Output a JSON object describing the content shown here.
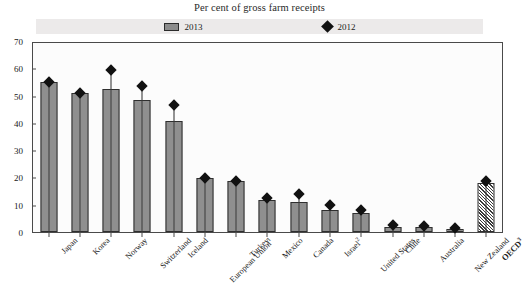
{
  "chart_data": {
    "type": "bar",
    "title": "Per cent of gross farm receipts",
    "xlabel": "",
    "ylabel": "",
    "ylim": [
      0,
      70
    ],
    "ytick_step": 10,
    "yticks": [
      0,
      10,
      20,
      30,
      40,
      50,
      60,
      70
    ],
    "grid": false,
    "legend_position": "top-center",
    "categories": [
      "Japan",
      "Korea",
      "Norway",
      "Switzerland",
      "Iceland",
      "European Union",
      "Turkey",
      "Mexico",
      "Canada",
      "Israel",
      "United States",
      "Chile",
      "Australia",
      "New Zealand",
      "OECD"
    ],
    "category_footnotes": {
      "European Union": "1",
      "Israel": "2",
      "OECD": "3"
    },
    "series": [
      {
        "name": "2013",
        "type": "bar",
        "color": "#8f8f8f",
        "values": [
          55.5,
          51.5,
          53.0,
          49.0,
          41.0,
          20.0,
          19.0,
          12.0,
          11.0,
          8.0,
          7.0,
          2.0,
          1.8,
          1.0,
          18.0
        ]
      },
      {
        "name": "2012",
        "type": "marker",
        "marker": "diamond",
        "color": "#111111",
        "values": [
          55.5,
          51.5,
          60.0,
          54.0,
          47.0,
          20.0,
          19.0,
          12.5,
          14.0,
          10.0,
          8.0,
          2.5,
          2.2,
          1.4,
          19.0
        ]
      }
    ]
  },
  "legend": {
    "items": [
      {
        "label": "2013",
        "symbol": "grey-bar-swatch"
      },
      {
        "label": "2012",
        "symbol": "black-diamond-marker"
      }
    ]
  },
  "colors": {
    "bar_fill": "#8f8f8f",
    "bar_stroke": "#2f2f2f",
    "marker": "#111111",
    "frame": "#4a4a4a",
    "legend_band": "#eceaea",
    "plot_background": "#fcfcfc"
  }
}
